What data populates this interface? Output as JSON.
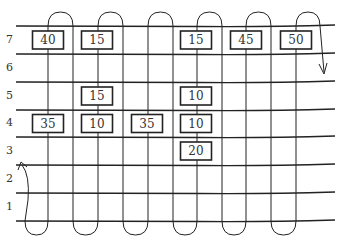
{
  "diagram": {
    "type": "serpentine-grid",
    "rows": [
      {
        "label": "7",
        "line_y": 26
      },
      {
        "label": "6",
        "line_y": 54
      },
      {
        "label": "5",
        "line_y": 82
      },
      {
        "label": "4",
        "line_y": 110
      },
      {
        "label": "3",
        "line_y": 137
      },
      {
        "label": "2",
        "line_y": 165
      },
      {
        "label": "1",
        "line_y": 193
      }
    ],
    "bottom_line_y": 221,
    "columns_x": [
      25,
      48,
      73,
      98,
      123,
      148,
      173,
      197,
      222,
      246,
      271,
      296,
      320
    ],
    "boxes": [
      {
        "row": "7",
        "x": 48,
        "value": "40"
      },
      {
        "row": "7",
        "x": 97,
        "value": "15"
      },
      {
        "row": "7",
        "x": 196,
        "value": "15"
      },
      {
        "row": "7",
        "x": 246,
        "value": "45"
      },
      {
        "row": "7",
        "x": 296,
        "value": "50"
      },
      {
        "row": "5",
        "x": 97,
        "value": "15"
      },
      {
        "row": "5",
        "x": 196,
        "value": "10"
      },
      {
        "row": "4",
        "x": 48,
        "value": "35"
      },
      {
        "row": "4",
        "x": 97,
        "value": "10"
      },
      {
        "row": "4",
        "x": 147,
        "value": "35"
      },
      {
        "row": "4",
        "x": 196,
        "value": "10"
      },
      {
        "row": "3",
        "x": 196,
        "value": "20"
      }
    ],
    "path": {
      "start": "row 2 left, arrow pointing up-left",
      "end": "right side between rows 6 and 5, arrow pointing down"
    }
  }
}
